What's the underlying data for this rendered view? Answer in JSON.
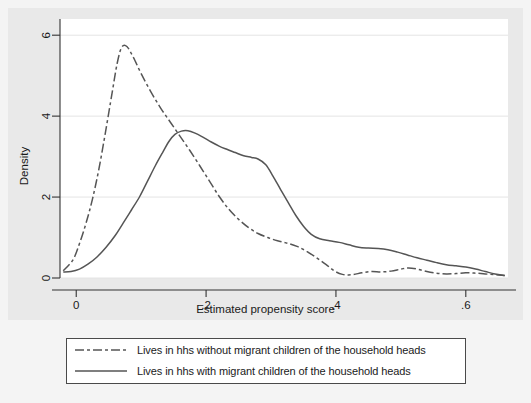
{
  "chart_data": {
    "type": "line",
    "title": "",
    "subtitle": "",
    "xlabel": "Estimated propensity score",
    "ylabel": "Density",
    "xlim": [
      -0.025,
      0.665
    ],
    "ylim": [
      0,
      6.4
    ],
    "xticks": [
      0,
      0.2,
      0.4,
      0.6
    ],
    "xticklabels": [
      "0",
      ".2",
      ".4",
      ".6"
    ],
    "yticks": [
      0,
      2,
      4,
      6
    ],
    "yticklabels": [
      "0",
      "2",
      "4",
      "6"
    ],
    "grid": "horizontal",
    "legend_position": "below-plot",
    "series": [
      {
        "name": "Lives in hhs without migrant children of the household heads",
        "style": "dash-dot",
        "color": "#555555",
        "points": [
          [
            -0.02,
            0.18
          ],
          [
            -0.005,
            0.45
          ],
          [
            0.005,
            0.85
          ],
          [
            0.015,
            1.35
          ],
          [
            0.025,
            1.95
          ],
          [
            0.035,
            2.7
          ],
          [
            0.045,
            3.6
          ],
          [
            0.055,
            4.55
          ],
          [
            0.063,
            5.3
          ],
          [
            0.07,
            5.7
          ],
          [
            0.078,
            5.72
          ],
          [
            0.088,
            5.45
          ],
          [
            0.1,
            5.05
          ],
          [
            0.115,
            4.6
          ],
          [
            0.13,
            4.2
          ],
          [
            0.145,
            3.85
          ],
          [
            0.16,
            3.5
          ],
          [
            0.175,
            3.15
          ],
          [
            0.19,
            2.78
          ],
          [
            0.205,
            2.4
          ],
          [
            0.22,
            2.02
          ],
          [
            0.235,
            1.7
          ],
          [
            0.25,
            1.45
          ],
          [
            0.265,
            1.25
          ],
          [
            0.28,
            1.1
          ],
          [
            0.295,
            1.0
          ],
          [
            0.31,
            0.92
          ],
          [
            0.325,
            0.86
          ],
          [
            0.34,
            0.78
          ],
          [
            0.355,
            0.66
          ],
          [
            0.37,
            0.5
          ],
          [
            0.385,
            0.33
          ],
          [
            0.398,
            0.17
          ],
          [
            0.41,
            0.09
          ],
          [
            0.425,
            0.08
          ],
          [
            0.44,
            0.13
          ],
          [
            0.455,
            0.16
          ],
          [
            0.47,
            0.15
          ],
          [
            0.485,
            0.17
          ],
          [
            0.5,
            0.22
          ],
          [
            0.512,
            0.25
          ],
          [
            0.525,
            0.22
          ],
          [
            0.54,
            0.16
          ],
          [
            0.555,
            0.12
          ],
          [
            0.57,
            0.1
          ],
          [
            0.585,
            0.11
          ],
          [
            0.6,
            0.13
          ],
          [
            0.615,
            0.12
          ],
          [
            0.63,
            0.1
          ],
          [
            0.645,
            0.08
          ],
          [
            0.66,
            0.06
          ]
        ]
      },
      {
        "name": "Lives in hhs with migrant children of the household heads",
        "style": "solid",
        "color": "#555555",
        "points": [
          [
            -0.02,
            0.15
          ],
          [
            -0.008,
            0.16
          ],
          [
            0.005,
            0.22
          ],
          [
            0.018,
            0.34
          ],
          [
            0.032,
            0.52
          ],
          [
            0.046,
            0.76
          ],
          [
            0.06,
            1.05
          ],
          [
            0.072,
            1.35
          ],
          [
            0.085,
            1.68
          ],
          [
            0.098,
            2.02
          ],
          [
            0.11,
            2.4
          ],
          [
            0.122,
            2.78
          ],
          [
            0.133,
            3.1
          ],
          [
            0.143,
            3.38
          ],
          [
            0.152,
            3.55
          ],
          [
            0.162,
            3.63
          ],
          [
            0.172,
            3.64
          ],
          [
            0.183,
            3.58
          ],
          [
            0.195,
            3.48
          ],
          [
            0.208,
            3.36
          ],
          [
            0.22,
            3.26
          ],
          [
            0.232,
            3.18
          ],
          [
            0.245,
            3.1
          ],
          [
            0.258,
            3.02
          ],
          [
            0.27,
            2.98
          ],
          [
            0.28,
            2.94
          ],
          [
            0.292,
            2.8
          ],
          [
            0.303,
            2.52
          ],
          [
            0.315,
            2.18
          ],
          [
            0.327,
            1.85
          ],
          [
            0.338,
            1.55
          ],
          [
            0.35,
            1.28
          ],
          [
            0.362,
            1.08
          ],
          [
            0.375,
            0.97
          ],
          [
            0.39,
            0.92
          ],
          [
            0.405,
            0.88
          ],
          [
            0.42,
            0.82
          ],
          [
            0.435,
            0.76
          ],
          [
            0.45,
            0.74
          ],
          [
            0.465,
            0.73
          ],
          [
            0.48,
            0.7
          ],
          [
            0.495,
            0.64
          ],
          [
            0.51,
            0.57
          ],
          [
            0.525,
            0.5
          ],
          [
            0.54,
            0.44
          ],
          [
            0.555,
            0.38
          ],
          [
            0.57,
            0.33
          ],
          [
            0.585,
            0.3
          ],
          [
            0.6,
            0.27
          ],
          [
            0.615,
            0.22
          ],
          [
            0.63,
            0.16
          ],
          [
            0.645,
            0.1
          ],
          [
            0.66,
            0.06
          ]
        ]
      }
    ]
  },
  "legend": {
    "entries": [
      {
        "label": "Lives in hhs without migrant children of the household heads",
        "key": "dash-dot-line-key"
      },
      {
        "label": "Lives in hhs with migrant children of the household heads",
        "key": "solid-line-key"
      }
    ]
  },
  "colors": {
    "page_background": "#f4f4f4",
    "graph_region": "#e9e9e9",
    "plot_background": "#ffffff",
    "line": "#555555",
    "axis": "#333333",
    "gridline": "#e4e4e4",
    "text": "#1a1a1a"
  }
}
